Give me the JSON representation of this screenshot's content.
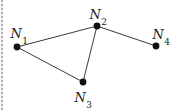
{
  "figure": {
    "type": "graph-diagram",
    "background": "#ffffff",
    "left_border_color": "#aeaeae",
    "edge_color": "#3a3a3a",
    "edge_width": 1,
    "node_color": "#101010",
    "node_radius": 3.4,
    "nodes": [
      {
        "id": "n1",
        "x": 17,
        "y": 47,
        "label_base": "N",
        "label_sub": "1",
        "label_x": 19,
        "label_y": 33
      },
      {
        "id": "n2",
        "x": 97,
        "y": 26,
        "label_base": "N",
        "label_sub": "2",
        "label_x": 98,
        "label_y": 14
      },
      {
        "id": "n3",
        "x": 83,
        "y": 82,
        "label_base": "N",
        "label_sub": "3",
        "label_x": 83,
        "label_y": 97
      },
      {
        "id": "n4",
        "x": 156,
        "y": 46,
        "label_base": "N",
        "label_sub": "4",
        "label_x": 161,
        "label_y": 34
      }
    ],
    "edges": [
      {
        "from": "n1",
        "to": "n2"
      },
      {
        "from": "n1",
        "to": "n3"
      },
      {
        "from": "n2",
        "to": "n3"
      },
      {
        "from": "n2",
        "to": "n4"
      }
    ]
  }
}
